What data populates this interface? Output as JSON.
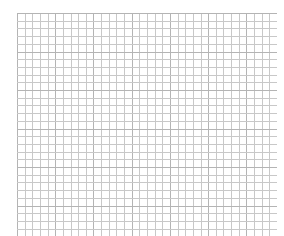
{
  "grid": {
    "columns": 34,
    "rows": 29,
    "line_color": "#c8c8c8",
    "major_line_color": "#b4b4b4",
    "major_every": 5,
    "background": "#ffffff"
  }
}
